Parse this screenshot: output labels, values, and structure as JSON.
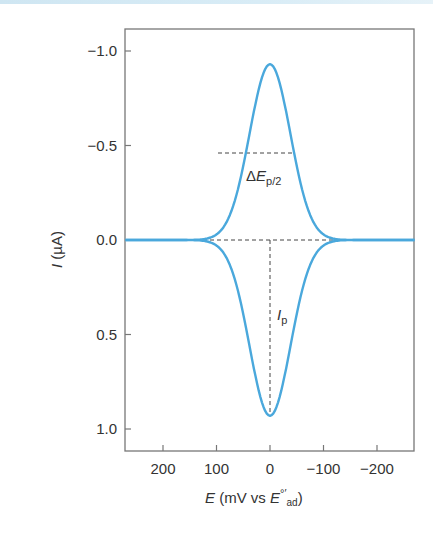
{
  "chart_data": {
    "type": "line",
    "title": "",
    "xlabel": "E (mV vs E°'ad)",
    "ylabel": "I (µA)",
    "xlim": [
      270,
      -270
    ],
    "ylim": [
      -1.2,
      1.12
    ],
    "x_ticks": [
      200,
      100,
      0,
      -100,
      -200
    ],
    "x_tick_labels": [
      "200",
      "100",
      "0",
      "−100",
      "−200"
    ],
    "y_ticks": [
      -1.0,
      -0.5,
      0.0,
      0.5,
      1.0
    ],
    "y_tick_labels": [
      "−1.0",
      "−0.5",
      "0.0",
      "0.5",
      "1.0"
    ],
    "y_axis_inverted": true,
    "grid": false,
    "legend": null,
    "series": [
      {
        "name": "anodic (upper) peak",
        "x": [
          270,
          200,
          150,
          100,
          75,
          50,
          25,
          0,
          -25,
          -50,
          -75,
          -100,
          -150,
          -200,
          -270
        ],
        "y": [
          0.0,
          0.0,
          -0.02,
          -0.12,
          -0.27,
          -0.47,
          -0.78,
          -0.93,
          -0.78,
          -0.47,
          -0.27,
          -0.12,
          -0.02,
          0.0,
          0.0
        ],
        "color": "#4aa8dc"
      },
      {
        "name": "cathodic (lower) peak",
        "x": [
          270,
          200,
          150,
          100,
          75,
          50,
          25,
          0,
          -25,
          -50,
          -75,
          -100,
          -150,
          -200,
          -270
        ],
        "y": [
          0.0,
          0.0,
          0.02,
          0.12,
          0.27,
          0.47,
          0.78,
          0.93,
          0.78,
          0.47,
          0.27,
          0.12,
          0.02,
          0.0,
          0.0
        ],
        "color": "#4aa8dc"
      }
    ],
    "annotations": [
      {
        "text": "ΔE_p/2",
        "type": "dashed horizontal line at half peak height",
        "y": -0.47,
        "x_from": 45,
        "x_to": -45
      },
      {
        "text": "I_p",
        "type": "dashed vertical line from baseline to lower peak",
        "x": 0,
        "y_from": 0.0,
        "y_to": 0.93
      },
      {
        "text": "",
        "type": "dashed baseline",
        "y": 0.0,
        "x_from": 160,
        "x_to": -160
      }
    ]
  },
  "labels": {
    "y_axis": {
      "italic": "I",
      "rest": " (µA)"
    },
    "x_axis": {
      "italic_main": "E",
      "unit": " (mV vs ",
      "italic_ref": "E",
      "ref_sup": "°′",
      "ref_sub": "ad",
      "close": ")"
    },
    "delta_ep": {
      "delta": "Δ",
      "italic": "E",
      "sub": "p/2"
    },
    "ip": {
      "italic": "I",
      "sub": "p"
    }
  },
  "colors": {
    "curve": "#4aa8dc",
    "axis": "#777777",
    "dash": "#444444",
    "text": "#333333"
  }
}
